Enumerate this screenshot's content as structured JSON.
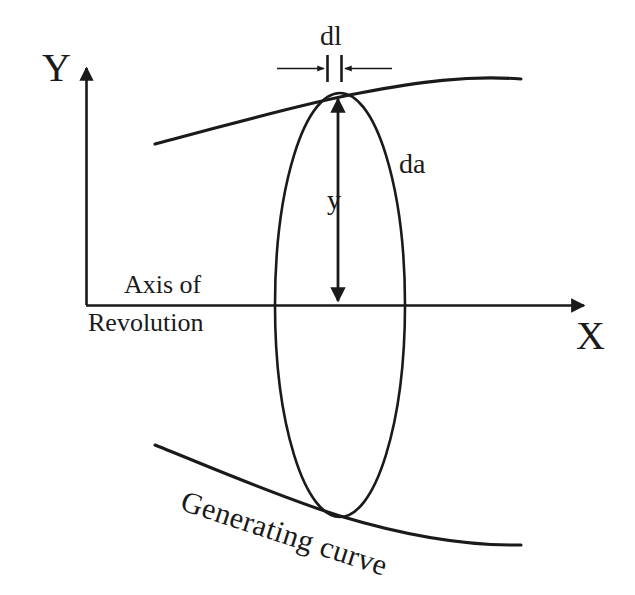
{
  "figure": {
    "background_color": "#ffffff",
    "stroke_color": "#1a1a1a",
    "text_color": "#1a1a1a"
  },
  "axes": {
    "y_label": "Y",
    "x_label": "X",
    "origin": {
      "x": 86,
      "y": 305
    },
    "x_axis_end": {
      "x": 590,
      "y": 305
    },
    "y_axis_end": {
      "x": 86,
      "y": 62
    }
  },
  "labels": {
    "dl": "dl",
    "da": "da",
    "y": "y",
    "axis_of": "Axis of",
    "revolution": "Revolution",
    "generating_curve": "Generating curve"
  },
  "geometry": {
    "ellipse": {
      "center_x": 340,
      "center_y": 305,
      "rx": 65,
      "ry": 212
    },
    "upper_curve": {
      "start": {
        "x": 155,
        "y": 144
      },
      "peak": {
        "x": 470,
        "y": 77
      },
      "end": {
        "x": 521,
        "y": 79
      }
    },
    "lower_curve": {
      "start": {
        "x": 155,
        "y": 445
      },
      "end": {
        "x": 521,
        "y": 545
      }
    },
    "y_dimension_arrow": {
      "x": 338,
      "top_y": 94,
      "bottom_y": 306
    },
    "dl_dimension": {
      "tick_left_x": 327,
      "tick_right_x": 341,
      "tick_top_y": 55,
      "tick_bottom_y": 82,
      "arrow_left_start_x": 277,
      "arrow_right_end_x": 392,
      "arrow_y": 68
    }
  }
}
